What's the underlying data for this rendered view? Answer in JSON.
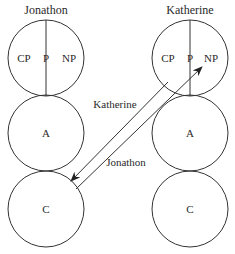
{
  "people": {
    "left": {
      "name": "Jonathon",
      "parent": {
        "segments": [
          "CP",
          "P",
          "NP"
        ]
      },
      "adult": "A",
      "child": "C"
    },
    "right": {
      "name": "Katherine",
      "parent": {
        "segments": [
          "CP",
          "P",
          "NP"
        ]
      },
      "adult": "A",
      "child": "C"
    }
  },
  "transactions": {
    "stimulus_label": "Katherine",
    "response_label": "Jonathon"
  },
  "colors": {
    "stroke": "#333333",
    "text": "#2a2a2a",
    "background": "#ffffff"
  }
}
